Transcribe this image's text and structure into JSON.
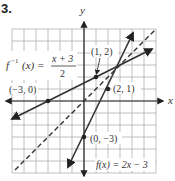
{
  "problem": {
    "number": "3."
  },
  "axes": {
    "x_label": "x",
    "y_label": "y",
    "origin_px": [
      84,
      101
    ],
    "unit_px": 12,
    "range": {
      "xmin": -6,
      "xmax": 6,
      "ymin": -6,
      "ymax": 6
    }
  },
  "colors": {
    "line": "#333333",
    "grid": "#b0b0b0",
    "text": "#333333"
  },
  "functions": {
    "f": {
      "label": "f(x) = 2x − 3",
      "expr": "2x - 3",
      "style": "solid"
    },
    "f_inverse": {
      "label_left": "f",
      "label_sup": "−1",
      "label_mid": "(x) = ",
      "numerator": "x + 3",
      "denominator": "2",
      "expr": "(x + 3)/2",
      "style": "solid"
    },
    "identity": {
      "expr": "x",
      "style": "dashed"
    }
  },
  "points": [
    {
      "label": "(1, 2)",
      "x": 1,
      "y": 2
    },
    {
      "label": "(−3, 0)",
      "x": -3,
      "y": 0
    },
    {
      "label": "(2, 1)",
      "x": 2,
      "y": 1
    },
    {
      "label": "(0, −3)",
      "x": 0,
      "y": -3
    }
  ]
}
